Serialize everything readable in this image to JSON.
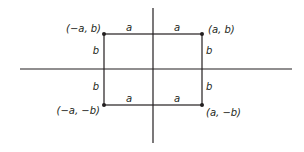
{
  "diagram": {
    "type": "coordinate-rectangle",
    "colors": {
      "line": "#231f20",
      "background": "#ffffff"
    },
    "axes": {
      "horizontal": {
        "x1": 20,
        "x2": 292,
        "y": 69
      },
      "vertical": {
        "x": 153,
        "y1": 8,
        "y2": 143
      }
    },
    "rectangle": {
      "left": 104,
      "right": 202,
      "top": 34,
      "bottom": 105
    },
    "vertices": {
      "top_left": "(−a, b)",
      "top_right": "(a, b)",
      "bottom_left": "(−a, −b)",
      "bottom_right": "(a, −b)"
    },
    "side_labels": {
      "top_left_a": "a",
      "top_right_a": "a",
      "bottom_left_a": "a",
      "bottom_right_a": "a",
      "left_upper_b": "b",
      "left_lower_b": "b",
      "right_upper_b": "b",
      "right_lower_b": "b"
    }
  }
}
